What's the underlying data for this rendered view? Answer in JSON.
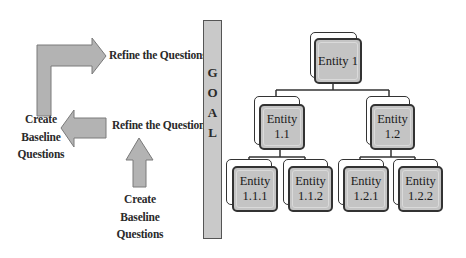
{
  "diagram": {
    "left_flow": {
      "labels": {
        "refine_top": "Refine the Questions",
        "refine_middle": "Refine the Questions",
        "create_left": [
          "Create",
          "Baseline",
          "Questions"
        ],
        "create_bottom": [
          "Create",
          "Baseline",
          "Questions"
        ]
      },
      "arrows": [
        {
          "name": "bent-arrow",
          "from": "Create Baseline Questions (left)",
          "to": "Refine the Questions (top)",
          "direction": "up-then-right"
        },
        {
          "name": "left-arrow",
          "from": "Refine the Questions (middle)",
          "to": "Create Baseline Questions (left)",
          "direction": "left"
        },
        {
          "name": "up-arrow",
          "from": "Create Baseline Questions (bottom)",
          "to": "Refine the Questions (middle)",
          "direction": "up"
        }
      ]
    },
    "goal": {
      "letters": [
        "G",
        "O",
        "A",
        "L"
      ]
    },
    "hierarchy": {
      "root": {
        "line1": "Entity 1",
        "line2": ""
      },
      "level1": [
        {
          "line1": "Entity",
          "line2": "1.1"
        },
        {
          "line1": "Entity",
          "line2": "1.2"
        }
      ],
      "level2": [
        {
          "line1": "Entity",
          "line2": "1.1.1"
        },
        {
          "line1": "Entity",
          "line2": "1.1.2"
        },
        {
          "line1": "Entity",
          "line2": "1.2.1"
        },
        {
          "line1": "Entity",
          "line2": "1.2.2"
        }
      ]
    },
    "colors": {
      "arrow_fill": "#b3b3b3",
      "arrow_stroke": "#7a7a7a",
      "box_fill": "#c4c4c4",
      "goal_fill": "#c9c9c9",
      "line": "#333333"
    }
  }
}
